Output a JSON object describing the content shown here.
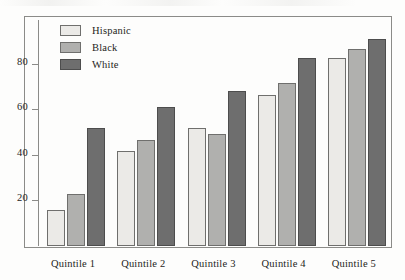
{
  "chart_data": {
    "type": "bar",
    "title": "",
    "xlabel": "",
    "ylabel": "",
    "categories": [
      "Quintile 1",
      "Quintile 2",
      "Quintile 3",
      "Quintile 4",
      "Quintile 5"
    ],
    "series": [
      {
        "name": "Hispanic",
        "color": "#ebeae7",
        "values": [
          16,
          42,
          52,
          67,
          83
        ]
      },
      {
        "name": "Black",
        "color": "#b0b0ae",
        "values": [
          23,
          47,
          49.5,
          72,
          87
        ]
      },
      {
        "name": "White",
        "color": "#6e6e6e",
        "values": [
          52,
          61.5,
          68.5,
          83,
          91.5
        ]
      }
    ],
    "yticks": [
      20,
      40,
      60,
      80
    ],
    "ylim": [
      0,
      100
    ],
    "grid": false,
    "legend_position": "top-left",
    "axis_color": "#8b8b88"
  },
  "legend": {
    "items": [
      {
        "label": "Hispanic"
      },
      {
        "label": "Black"
      },
      {
        "label": "White"
      }
    ]
  }
}
